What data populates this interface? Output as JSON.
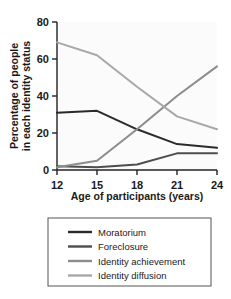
{
  "chart_data": {
    "type": "line",
    "title": "",
    "xlabel": "Age of participants (years)",
    "ylabel": "Percentage of people in each identity status",
    "ylabel_line1": "Percentage of people",
    "ylabel_line2": "in each identity status",
    "x": [
      12,
      15,
      18,
      21,
      24
    ],
    "xtick_labels": [
      "12",
      "15",
      "18",
      "21",
      "24"
    ],
    "ytick_labels": [
      "0",
      "20",
      "40",
      "60",
      "80"
    ],
    "yticks": [
      0,
      20,
      40,
      60,
      80
    ],
    "xlim": [
      12,
      24
    ],
    "ylim": [
      0,
      80
    ],
    "grid": false,
    "legend_position": "bottom",
    "series": [
      {
        "name": "Moratorium",
        "color": "#2b2b2b",
        "values": [
          31,
          32,
          22,
          14,
          12
        ]
      },
      {
        "name": "Foreclosure",
        "color": "#4d4d4d",
        "values": [
          2,
          1.5,
          3,
          9,
          9
        ]
      },
      {
        "name": "Identity achievement",
        "color": "#8c8c8c",
        "values": [
          1.5,
          5,
          22,
          40,
          56
        ]
      },
      {
        "name": "Identity diffusion",
        "color": "#a8a8a8",
        "values": [
          69,
          62,
          45,
          29,
          22
        ]
      }
    ]
  },
  "legend": {
    "items": [
      {
        "label": "Moratorium",
        "color": "#2b2b2b"
      },
      {
        "label": "Foreclosure",
        "color": "#4d4d4d"
      },
      {
        "label": "Identity achievement",
        "color": "#8c8c8c"
      },
      {
        "label": "Identity diffusion",
        "color": "#a8a8a8"
      }
    ]
  },
  "colors": {
    "axis": "#222222",
    "plot_background": "#fafafa",
    "legend_border": "#555555",
    "page_background": "#ffffff"
  }
}
